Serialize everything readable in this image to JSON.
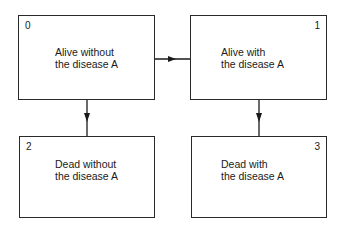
{
  "diagram": {
    "states": [
      {
        "id": "0",
        "line1": "Alive without",
        "line2": "the disease A"
      },
      {
        "id": "1",
        "line1": "Alive with",
        "line2": "the disease A"
      },
      {
        "id": "2",
        "line1": "Dead without",
        "line2": "the disease A"
      },
      {
        "id": "3",
        "line1": "Dead with",
        "line2": "the disease A"
      }
    ],
    "transitions": [
      {
        "from": "0",
        "to": "1"
      },
      {
        "from": "0",
        "to": "2"
      },
      {
        "from": "1",
        "to": "3"
      }
    ]
  }
}
